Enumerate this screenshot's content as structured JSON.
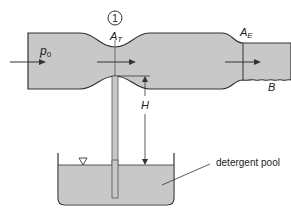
{
  "diagram": {
    "type": "venturi-aspirator",
    "labels": {
      "inlet_pressure": "p",
      "inlet_pressure_sub": "0",
      "station_number": "1",
      "throat_area": "A",
      "throat_area_sub": "T",
      "exit_area": "A",
      "exit_area_sub": "E",
      "exit_point": "B",
      "height": "H",
      "pool": "detergent pool"
    },
    "colors": {
      "fluid_fill": "#c8c8c8",
      "outline": "#333333",
      "arrow": "#333333"
    }
  }
}
